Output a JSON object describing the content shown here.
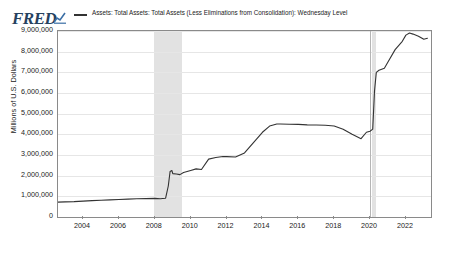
{
  "header": {
    "logo_text": "FRED",
    "logo_mark": "chart-line-icon"
  },
  "legend": {
    "series_label": "Assets: Total Assets: Total Assets (Less Eliminations from Consolidation): Wednesday Level",
    "swatch_color": "#333333"
  },
  "chart_data": {
    "type": "line",
    "title": "",
    "subtitle": "",
    "xlabel": "",
    "ylabel": "Millions of U.S. Dollars",
    "xlim": [
      2002.6,
      2023.4
    ],
    "ylim": [
      0,
      9000000
    ],
    "grid": true,
    "legend_position": "top",
    "line_color": "#333333",
    "series": [
      {
        "name": "Assets: Total Assets: Total Assets (Less Eliminations from Consolidation): Wednesday Level",
        "x": [
          2002.6,
          2003.0,
          2003.5,
          2004.0,
          2004.5,
          2005.0,
          2005.5,
          2006.0,
          2006.5,
          2007.0,
          2007.5,
          2008.0,
          2008.3,
          2008.6,
          2008.75,
          2008.85,
          2008.95,
          2009.0,
          2009.2,
          2009.4,
          2009.6,
          2009.8,
          2010.0,
          2010.3,
          2010.6,
          2011.0,
          2011.4,
          2011.8,
          2012.0,
          2012.5,
          2013.0,
          2013.5,
          2014.0,
          2014.4,
          2014.8,
          2015.0,
          2015.5,
          2016.0,
          2016.5,
          2017.0,
          2017.5,
          2018.0,
          2018.5,
          2019.0,
          2019.5,
          2019.8,
          2020.0,
          2020.15,
          2020.25,
          2020.35,
          2020.5,
          2020.8,
          2021.0,
          2021.4,
          2021.8,
          2022.0,
          2022.2,
          2022.4,
          2022.7,
          2023.0,
          2023.2
        ],
        "y": [
          720000,
          730000,
          745000,
          770000,
          790000,
          810000,
          830000,
          850000,
          865000,
          880000,
          890000,
          900000,
          880000,
          910000,
          1500000,
          2200000,
          2250000,
          2100000,
          2080000,
          2050000,
          2150000,
          2200000,
          2250000,
          2330000,
          2300000,
          2800000,
          2880000,
          2930000,
          2920000,
          2900000,
          3100000,
          3600000,
          4100000,
          4400000,
          4500000,
          4500000,
          4490000,
          4480000,
          4460000,
          4450000,
          4440000,
          4400000,
          4250000,
          4000000,
          3790000,
          4100000,
          4150000,
          4250000,
          6100000,
          7000000,
          7100000,
          7200000,
          7500000,
          8100000,
          8500000,
          8800000,
          8900000,
          8850000,
          8750000,
          8600000,
          8650000
        ]
      }
    ],
    "y_ticks": [
      0,
      1000000,
      2000000,
      3000000,
      4000000,
      5000000,
      6000000,
      7000000,
      8000000,
      9000000
    ],
    "y_tick_labels": [
      "0",
      "1,000,000",
      "2,000,000",
      "3,000,000",
      "4,000,000",
      "5,000,000",
      "6,000,000",
      "7,000,000",
      "8,000,000",
      "9,000,000"
    ],
    "x_ticks": [
      2004,
      2006,
      2008,
      2010,
      2012,
      2014,
      2016,
      2018,
      2020,
      2022
    ],
    "x_tick_labels": [
      "2004",
      "2006",
      "2008",
      "2010",
      "2012",
      "2014",
      "2016",
      "2018",
      "2020",
      "2022"
    ],
    "recession_bands": [
      {
        "start": 2007.95,
        "end": 2009.5,
        "color": "#e2e2e2"
      },
      {
        "start": 2020.1,
        "end": 2020.35,
        "color": "#e2e2e2"
      }
    ],
    "event_lines": [
      {
        "x": 2020.0,
        "color": "#b5b5b5"
      }
    ]
  }
}
